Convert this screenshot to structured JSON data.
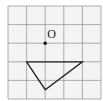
{
  "figure": {
    "grid": {
      "cols": 5,
      "rows": 5,
      "origin_px": [
        8,
        6
      ],
      "cell_px": 18.6,
      "line_color": "#9a9a9a",
      "background": "#f4f4f4"
    },
    "point": {
      "label": "O",
      "grid_pos": [
        2,
        2
      ],
      "color": "#111111"
    },
    "triangle": {
      "vertices_grid": [
        [
          1,
          3
        ],
        [
          4,
          3
        ],
        [
          2,
          4.5
        ]
      ],
      "stroke": "#222222"
    }
  }
}
